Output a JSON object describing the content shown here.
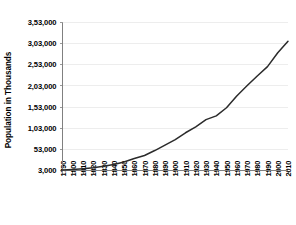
{
  "chart_data": {
    "type": "line",
    "title": "",
    "xlabel": "",
    "ylabel": "Population in Thousands",
    "x": [
      1790,
      1800,
      1810,
      1820,
      1830,
      1840,
      1850,
      1860,
      1870,
      1880,
      1890,
      1900,
      1910,
      1920,
      1930,
      1940,
      1950,
      1960,
      1970,
      1980,
      1990,
      2000,
      2010
    ],
    "categories": [
      "1790",
      "1800",
      "1810",
      "1820",
      "1830",
      "1840",
      "1850",
      "1860",
      "1870",
      "1880",
      "1890",
      "1900",
      "1910",
      "1920",
      "1930",
      "1940",
      "1950",
      "1960",
      "1970",
      "1980",
      "1990",
      "2000",
      "2010"
    ],
    "values": [
      3929,
      5308,
      7240,
      9638,
      12866,
      17069,
      23192,
      31443,
      38558,
      50189,
      62980,
      76212,
      92228,
      106022,
      123203,
      132165,
      151326,
      179323,
      203212,
      226546,
      248710,
      281422,
      308746
    ],
    "series": [
      {
        "name": "Population",
        "values": [
          3929,
          5308,
          7240,
          9638,
          12866,
          17069,
          23192,
          31443,
          38558,
          50189,
          62980,
          76212,
          92228,
          106022,
          123203,
          132165,
          151326,
          179323,
          203212,
          226546,
          248710,
          281422,
          308746
        ]
      }
    ],
    "ylim": [
      3000,
      353000
    ],
    "yticks": [
      3000,
      53000,
      103000,
      153000,
      203000,
      253000,
      303000,
      353000
    ],
    "ytick_labels": [
      "3,000",
      "53,000",
      "1,03,000",
      "1,53,000",
      "2,03,000",
      "2,53,000",
      "3,03,000",
      "3,53,000"
    ],
    "xlim": [
      1790,
      2010
    ],
    "grid": true,
    "grid_axis": "y",
    "legend": false,
    "legend_position": "none",
    "colors": {
      "line": "#2b2b2b",
      "gridline": "#e8e8e8",
      "axis": "#808080",
      "text": "#000000",
      "background": "#ffffff"
    }
  }
}
